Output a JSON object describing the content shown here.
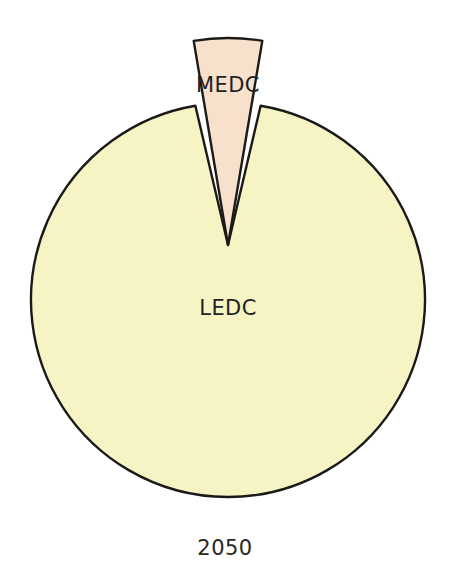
{
  "figure": {
    "caption": "2050",
    "background_color": "#ffffff",
    "outline_color": "#1c1a17"
  },
  "chart_data": {
    "type": "pie",
    "title": "",
    "subtitle": "",
    "xlabel": "",
    "ylabel": "",
    "caption": "2050",
    "legend_position": "none",
    "grid": false,
    "labels_inside_slices": true,
    "start_angle_deg": -90,
    "direction": "clockwise",
    "categories": [
      "MEDC",
      "LEDC"
    ],
    "values": [
      5.3,
      94.7
    ],
    "units": "percent",
    "colors": [
      "#f7e0cc",
      "#f6f4c5"
    ],
    "exploded": [
      true,
      false
    ],
    "slices": [
      {
        "label": "MEDC",
        "value": 5.3,
        "color": "#f7e0cc",
        "exploded": true,
        "angle_deg": 19
      },
      {
        "label": "LEDC",
        "value": 94.7,
        "color": "#f6f4c5",
        "exploded": false,
        "angle_deg": 341
      }
    ]
  },
  "slice_labels": {
    "medc": "MEDC",
    "ledc": "LEDC"
  }
}
